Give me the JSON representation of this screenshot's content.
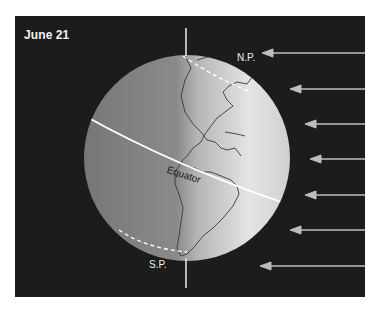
{
  "diagram": {
    "title": "June 21",
    "labels": {
      "north_pole": "N.P.",
      "south_pole": "S.P.",
      "equator": "Equator"
    },
    "sunlight_arrows": {
      "count": 7,
      "direction": "right-to-left",
      "color": "#bdbdbd"
    },
    "colors": {
      "background": "#1c1c1c",
      "globe_light": "#e6e6e6",
      "globe_dark": "#7a7a7a",
      "equator_line": "#ffffff",
      "text": "#f2f2f2"
    }
  }
}
